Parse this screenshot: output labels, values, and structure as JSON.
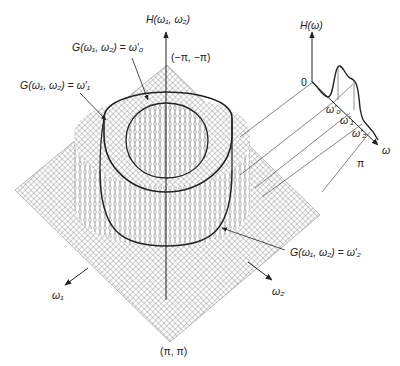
{
  "figure": {
    "type": "3D surface plot of 2D frequency response with 1D prototype",
    "main_axis_label": "H(ω₁, ω₂)",
    "corner_top_label": "(−π, −π)",
    "corner_bottom_label": "(π, π)",
    "axis_w1_label": "ω₁",
    "axis_w2_label": "ω₂",
    "contours": [
      {
        "id": "w0",
        "label": "G(ω₁, ω₂) = ω′₀"
      },
      {
        "id": "w1",
        "label": "G(ω₁, ω₂) = ω′₁"
      },
      {
        "id": "w2",
        "label": "G(ω₁, ω₂) = ω′₂"
      }
    ]
  },
  "inset": {
    "y_axis_label": "H(ω)",
    "origin_label": "0",
    "x_axis_label": "ω",
    "ticks": [
      "ω′₀",
      "ω′₁",
      "ω′₂",
      "π"
    ]
  },
  "colors": {
    "ink": "#222222",
    "mesh": "#6a6a6a",
    "background": "#ffffff"
  }
}
